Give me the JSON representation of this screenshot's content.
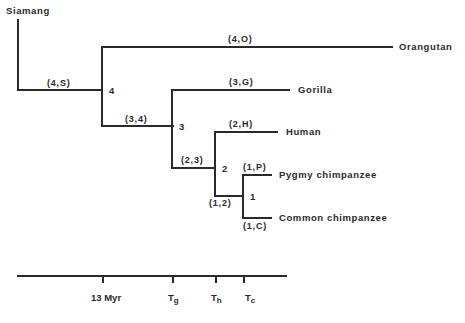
{
  "diagram": {
    "type": "phylogenetic-tree",
    "taxa": {
      "siamang": "Siamang",
      "orangutan": "Orangutan",
      "gorilla": "Gorilla",
      "human": "Human",
      "pygmy": "Pygmy chimpanzee",
      "common": "Common chimpanzee"
    },
    "edges": {
      "s4": "(4,S)",
      "o4": "(4,O)",
      "e34": "(3,4)",
      "g3": "(3,G)",
      "e23": "(2,3)",
      "h2": "(2,H)",
      "e12": "(1,2)",
      "p1": "(1,P)",
      "c1": "(1,C)"
    },
    "nodes": {
      "n4": "4",
      "n3": "3",
      "n2": "2",
      "n1": "1"
    },
    "time_axis": {
      "ticks": [
        {
          "label": "13 Myr",
          "sub": ""
        },
        {
          "label": "T",
          "sub": "g"
        },
        {
          "label": "T",
          "sub": "h"
        },
        {
          "label": "T",
          "sub": "c"
        }
      ]
    }
  }
}
